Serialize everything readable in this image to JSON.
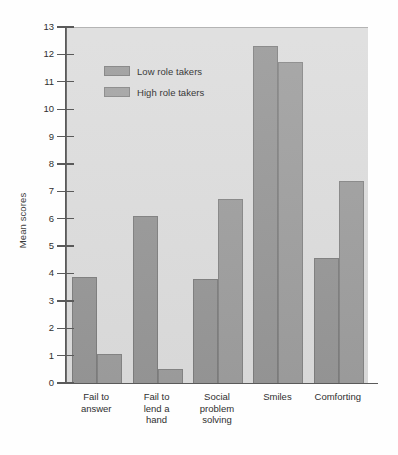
{
  "chart_data": {
    "type": "bar",
    "title": "",
    "subtitle": "",
    "xlabel": "",
    "ylabel": "Mean scores",
    "ylim": [
      0,
      13
    ],
    "ytick_labels": [
      "13",
      "12",
      "11",
      "10",
      "9",
      "8",
      "7",
      "6",
      "5",
      "4",
      "3",
      "2",
      "1",
      "0"
    ],
    "yticks": [
      13,
      12,
      11,
      10,
      9,
      8,
      7,
      6,
      5,
      4,
      3,
      2,
      1,
      0
    ],
    "grid": false,
    "legend_position": "upper-left-inside",
    "categories": [
      "Fail to\nanswer",
      "Fail to\nlend a\nhand",
      "Social\nproblem\nsolving",
      "Smiles",
      "Comforting"
    ],
    "categories_flat": [
      "Fail to answer",
      "Fail to lend a hand",
      "Social problem solving",
      "Smiles",
      "Comforting"
    ],
    "series": [
      {
        "name": "Low role takers",
        "color": "#969696",
        "values": [
          3.9,
          6.15,
          3.85,
          12.35,
          4.6
        ]
      },
      {
        "name": "High role takers",
        "color": "#9d9d9d",
        "values": [
          1.1,
          0.55,
          6.75,
          11.75,
          7.4
        ]
      }
    ],
    "plot_background": "#dcdcdc",
    "axis_color": "#5a5a5a"
  },
  "legend": {
    "items": [
      {
        "label": "Low role takers"
      },
      {
        "label": "High role takers"
      }
    ]
  },
  "axes": {
    "y_title": "Mean scores"
  }
}
